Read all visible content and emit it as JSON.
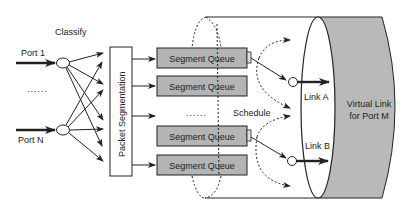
{
  "diagram": {
    "labels": {
      "classify": "Classify",
      "port_1": "Port 1",
      "port_n": "Port N",
      "ports_ellipsis": "......",
      "packet_segmentation": "Packet Segmentation",
      "queue_ellipsis": "......",
      "schedule": "Schedule",
      "link_a": "Link A",
      "link_b": "Link B",
      "virtual_link_line1": "Virtual Link",
      "virtual_link_line2": "for Port M"
    },
    "queues": [
      {
        "label": "Segment Queue"
      },
      {
        "label": "Segment Queue"
      },
      {
        "label": "Segment Queue"
      },
      {
        "label": "Segment Queue"
      }
    ],
    "colors": {
      "queue_fill": "#b4b4b4",
      "virtual_link_fill": "#b9b9b9",
      "stroke": "#222222",
      "background": "#ffffff"
    }
  }
}
